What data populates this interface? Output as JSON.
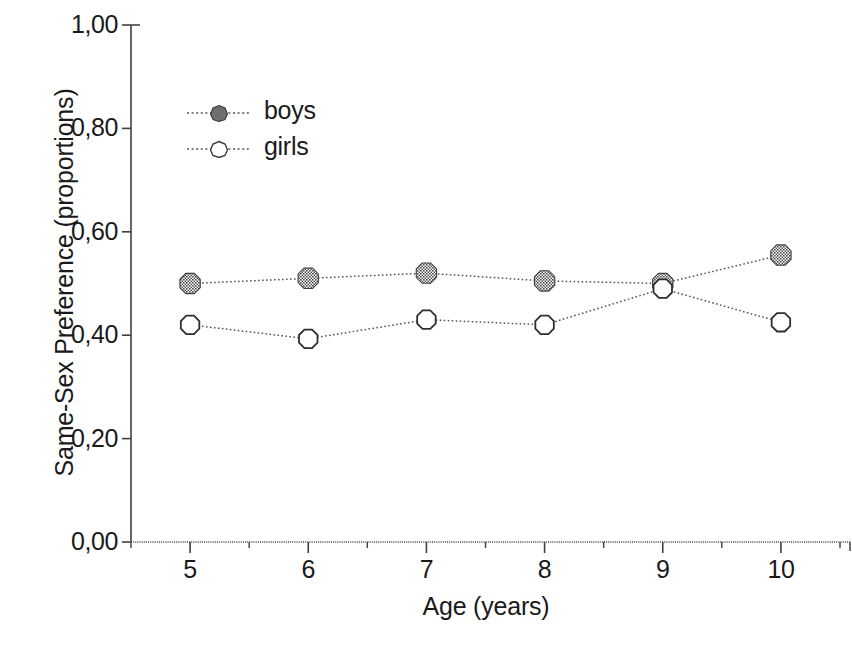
{
  "chart_data": {
    "type": "line",
    "title": "",
    "xlabel": "Age (years)",
    "ylabel": "Same-Sex Preference (proportions)",
    "x": [
      5,
      6,
      7,
      8,
      9,
      10
    ],
    "categories": [
      "5",
      "6",
      "7",
      "8",
      "9",
      "10"
    ],
    "xlim": [
      4.5,
      10.5
    ],
    "ylim": [
      0.0,
      1.0
    ],
    "xtick_labels": [
      "5",
      "6",
      "7",
      "8",
      "9",
      "10"
    ],
    "ytick_values": [
      0.0,
      0.2,
      0.4,
      0.6,
      0.8,
      1.0
    ],
    "ytick_labels": [
      "0,00",
      "0,20",
      "0,40",
      "0,60",
      "0,80",
      "1,00"
    ],
    "minor_xticks": true,
    "grid": false,
    "legend_position": "upper left",
    "decimal_separator": ",",
    "series": [
      {
        "name": "boys",
        "marker": "filled-octagon",
        "marker_color": "#6b6b6b",
        "line_style": "dotted",
        "values": [
          0.5,
          0.51,
          0.52,
          0.505,
          0.5,
          0.555
        ]
      },
      {
        "name": "girls",
        "marker": "open-octagon",
        "marker_color": "#ffffff",
        "line_style": "dotted",
        "values": [
          0.42,
          0.393,
          0.43,
          0.42,
          0.49,
          0.425
        ]
      }
    ]
  },
  "axes": {
    "y_title": "Same-Sex Preference (proportions)",
    "x_title": "Age (years)"
  },
  "legend": {
    "items": [
      {
        "label": "boys"
      },
      {
        "label": "girls"
      }
    ]
  },
  "colors": {
    "axis": "#404040",
    "line": "#555555",
    "marker_fill": "#6e6e6e",
    "marker_edge": "#333333",
    "background": "#ffffff"
  }
}
